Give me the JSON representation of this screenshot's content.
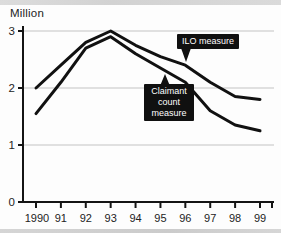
{
  "chart_data": {
    "type": "line",
    "ylabel": "Million",
    "categories": [
      "1990",
      "91",
      "92",
      "93",
      "94",
      "95",
      "96",
      "97",
      "98",
      "99"
    ],
    "series": [
      {
        "name": "ILO measure",
        "values": [
          2.0,
          2.4,
          2.8,
          3.0,
          2.75,
          2.55,
          2.4,
          2.1,
          1.85,
          1.8
        ]
      },
      {
        "name": "Claimant count measure",
        "values": [
          1.55,
          2.1,
          2.7,
          2.9,
          2.6,
          2.35,
          2.1,
          1.6,
          1.35,
          1.25
        ]
      }
    ],
    "ylim": [
      0,
      3
    ],
    "yticks": [
      0,
      1,
      2,
      3
    ],
    "grid": true,
    "legend_position": "inline-callouts",
    "annotations": [
      {
        "text": "ILO measure",
        "series": "ILO measure"
      },
      {
        "text": "Claimant\ncount\nmeasure",
        "series": "Claimant count measure"
      }
    ],
    "colors": {
      "line": "#111111",
      "grid": "#c3c3c3",
      "axis": "#141414",
      "tick_label": "#232323",
      "callout_bg": "#101010",
      "callout_text": "#ffffff"
    }
  }
}
